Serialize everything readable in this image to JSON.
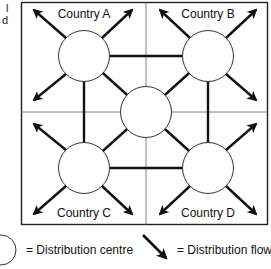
{
  "cropped_text": [
    "l",
    "d"
  ],
  "diagram": {
    "countries": [
      {
        "id": "A",
        "label": "Country A"
      },
      {
        "id": "B",
        "label": "Country B"
      },
      {
        "id": "C",
        "label": "Country C"
      },
      {
        "id": "D",
        "label": "Country D"
      }
    ],
    "nodes": [
      {
        "id": "A",
        "type": "distribution-centre"
      },
      {
        "id": "B",
        "type": "distribution-centre"
      },
      {
        "id": "C",
        "type": "distribution-centre"
      },
      {
        "id": "D",
        "type": "distribution-centre"
      },
      {
        "id": "Centre",
        "type": "distribution-centre"
      }
    ],
    "links": [
      [
        "A",
        "B"
      ],
      [
        "A",
        "C"
      ],
      [
        "B",
        "D"
      ],
      [
        "C",
        "D"
      ],
      [
        "A",
        "Centre"
      ],
      [
        "B",
        "Centre"
      ],
      [
        "C",
        "Centre"
      ],
      [
        "D",
        "Centre"
      ]
    ],
    "flows_per_country_centre": 4
  },
  "legend": {
    "circle_label": "= Distribution centre",
    "arrow_label": "= Distribution flow"
  },
  "colors": {
    "line": "#111111",
    "border": "#222222",
    "grid": "#777777",
    "fill": "#ffffff"
  }
}
